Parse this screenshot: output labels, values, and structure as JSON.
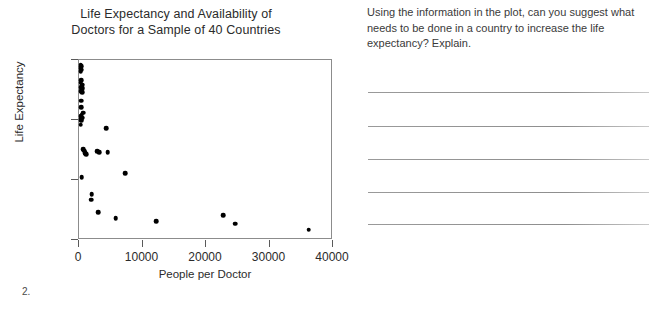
{
  "chart_data": {
    "type": "scatter",
    "title": "Life Expectancy and Availability of Doctors for a Sample of 40 Countries",
    "title_lines": [
      "Life Expectancy and Availability of",
      "Doctors for a Sample of 40 Countries"
    ],
    "xlabel": "People per Doctor",
    "ylabel": "Life Expectancy",
    "xlim": [
      0,
      40000
    ],
    "ylim": [
      50,
      80
    ],
    "xticks": [
      0,
      10000,
      20000,
      30000,
      40000
    ],
    "xtick_labels": [
      "0",
      "10000",
      "20000",
      "30000",
      "40000"
    ],
    "yticks": [
      50,
      60,
      70,
      80
    ],
    "ytick_labels": [
      "50",
      "60",
      "70",
      "80"
    ],
    "grid": false,
    "legend": null,
    "marker": "filled-circle",
    "marker_color": "#000000",
    "n_points": 40,
    "points": [
      {
        "x": 250,
        "y": 79.2
      },
      {
        "x": 330,
        "y": 79.0
      },
      {
        "x": 300,
        "y": 78.6
      },
      {
        "x": 420,
        "y": 78.4
      },
      {
        "x": 260,
        "y": 78.1
      },
      {
        "x": 350,
        "y": 76.6
      },
      {
        "x": 300,
        "y": 76.2
      },
      {
        "x": 480,
        "y": 75.9
      },
      {
        "x": 330,
        "y": 75.5
      },
      {
        "x": 600,
        "y": 75.3
      },
      {
        "x": 420,
        "y": 75.1
      },
      {
        "x": 300,
        "y": 74.8
      },
      {
        "x": 480,
        "y": 74.6
      },
      {
        "x": 330,
        "y": 73.2
      },
      {
        "x": 350,
        "y": 72.1
      },
      {
        "x": 700,
        "y": 71.2
      },
      {
        "x": 420,
        "y": 70.9
      },
      {
        "x": 300,
        "y": 70.6
      },
      {
        "x": 520,
        "y": 70.4
      },
      {
        "x": 330,
        "y": 70.1
      },
      {
        "x": 380,
        "y": 69.9
      },
      {
        "x": 300,
        "y": 69.2
      },
      {
        "x": 4300,
        "y": 68.6
      },
      {
        "x": 700,
        "y": 65.1
      },
      {
        "x": 800,
        "y": 64.9
      },
      {
        "x": 900,
        "y": 64.7
      },
      {
        "x": 1000,
        "y": 64.5
      },
      {
        "x": 1150,
        "y": 64.3
      },
      {
        "x": 2900,
        "y": 64.8
      },
      {
        "x": 3200,
        "y": 64.6
      },
      {
        "x": 4500,
        "y": 64.6
      },
      {
        "x": 7300,
        "y": 61.1
      },
      {
        "x": 450,
        "y": 60.5
      },
      {
        "x": 2000,
        "y": 57.6
      },
      {
        "x": 1900,
        "y": 56.7
      },
      {
        "x": 3000,
        "y": 54.6
      },
      {
        "x": 5800,
        "y": 53.6
      },
      {
        "x": 12200,
        "y": 53.1
      },
      {
        "x": 22700,
        "y": 54.1
      },
      {
        "x": 24600,
        "y": 52.7
      },
      {
        "x": 36200,
        "y": 51.7
      }
    ]
  },
  "worksheet": {
    "prompt": "Using the information in the plot, can you suggest what needs to be done in a country to increase the life expectancy? Explain.",
    "answer_lines": [
      "",
      "",
      "",
      "",
      ""
    ]
  },
  "page": {
    "question_number": "2."
  }
}
